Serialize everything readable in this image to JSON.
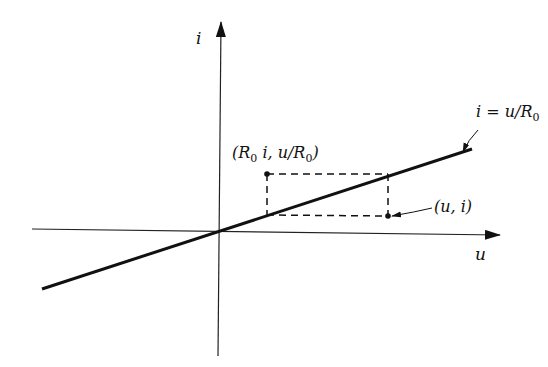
{
  "diagram": {
    "type": "current-voltage characteristic of a linear resistor",
    "axes": {
      "horizontal_label": "u",
      "vertical_label": "i"
    },
    "line": {
      "equation_label": "i = u/R",
      "equation_prefix": "i = u/R",
      "equation_subscript": "0"
    },
    "points": {
      "point_on_graph": {
        "label": "(u, i)"
      },
      "dual_point": {
        "label_open": "(R",
        "label_sub1": "0",
        "label_mid": " i, u/R",
        "label_sub2": "0",
        "label_close": ")"
      }
    },
    "colors": {
      "ink": "#111111",
      "background": "#ffffff"
    }
  }
}
